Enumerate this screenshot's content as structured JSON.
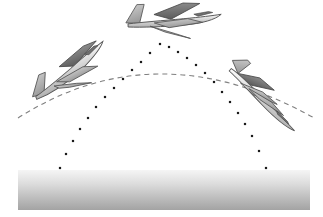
{
  "figure": {
    "kind": "physics-illustration",
    "canvas": {
      "width": 323,
      "height": 217,
      "background": "#ffffff"
    }
  },
  "ground": {
    "label": "ground-surface",
    "x": 18,
    "y": 170,
    "width": 292,
    "height": 40,
    "gradient_top_color": "#f2f2f2",
    "gradient_bottom_color": "#a6a6a6"
  },
  "trajectory_dotted": {
    "label": "parabolic-flight-path",
    "style": "dotted",
    "dot_color": "#1a1a1a",
    "dot_size": 2.2,
    "apex": {
      "x": 160,
      "y": 43
    },
    "left_end": {
      "x": 60,
      "y": 168
    },
    "right_end": {
      "x": 266,
      "y": 168
    },
    "points": [
      [
        60,
        168
      ],
      [
        66,
        154
      ],
      [
        73,
        141
      ],
      [
        80,
        129
      ],
      [
        88,
        118
      ],
      [
        96,
        107
      ],
      [
        105,
        97
      ],
      [
        114,
        88
      ],
      [
        123,
        79
      ],
      [
        132,
        70
      ],
      [
        141,
        62
      ],
      [
        150,
        53
      ],
      [
        160,
        44
      ],
      [
        169,
        47
      ],
      [
        178,
        52
      ],
      [
        187,
        58
      ],
      [
        196,
        65
      ],
      [
        205,
        73
      ],
      [
        214,
        82
      ],
      [
        222,
        92
      ],
      [
        230,
        102
      ],
      [
        238,
        113
      ],
      [
        245,
        124
      ],
      [
        252,
        136
      ],
      [
        259,
        151
      ],
      [
        266,
        168
      ]
    ]
  },
  "trajectory_dashed": {
    "label": "horizontal-reference-arc",
    "style": "dashed",
    "stroke_color": "#808080",
    "stroke_width": 1.1,
    "dash_pattern": "5 4",
    "left_end": {
      "x": 18,
      "y": 118
    },
    "apex": {
      "x": 162,
      "y": 74
    },
    "right_end": {
      "x": 316,
      "y": 119
    }
  },
  "aircraft": [
    {
      "name": "aircraft-ascending",
      "position_label": "left",
      "phase": "climbing",
      "x": 12,
      "y": 62,
      "rotation_deg": -22,
      "scale": 1.0,
      "body_color": "#d9d9d9",
      "wing_color": "#b3b3b3",
      "outline_color": "#4d4d4d"
    },
    {
      "name": "aircraft-apex",
      "position_label": "top",
      "phase": "weightless-at-apex",
      "x": 122,
      "y": 2,
      "rotation_deg": -2,
      "scale": 1.05,
      "body_color": "#d9d9d9",
      "wing_color": "#b3b3b3",
      "outline_color": "#4d4d4d"
    },
    {
      "name": "aircraft-descending",
      "position_label": "right",
      "phase": "descending",
      "x": 228,
      "y": 50,
      "rotation_deg": 22,
      "scale": 1.0,
      "body_color": "#d9d9d9",
      "wing_color": "#b3b3b3",
      "outline_color": "#4d4d4d"
    }
  ]
}
